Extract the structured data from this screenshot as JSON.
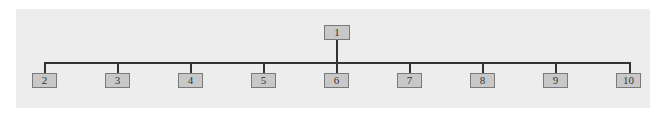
{
  "diagram": {
    "type": "tree",
    "root": {
      "label": "1"
    },
    "children": [
      {
        "label": "2"
      },
      {
        "label": "3"
      },
      {
        "label": "4"
      },
      {
        "label": "5"
      },
      {
        "label": "6"
      },
      {
        "label": "7"
      },
      {
        "label": "8"
      },
      {
        "label": "9"
      },
      {
        "label": "10"
      }
    ],
    "colors": {
      "background": "#ededed",
      "node_fill": "#c8c8c8",
      "node_border": "#7a7a7a",
      "connector": "#333333"
    }
  }
}
